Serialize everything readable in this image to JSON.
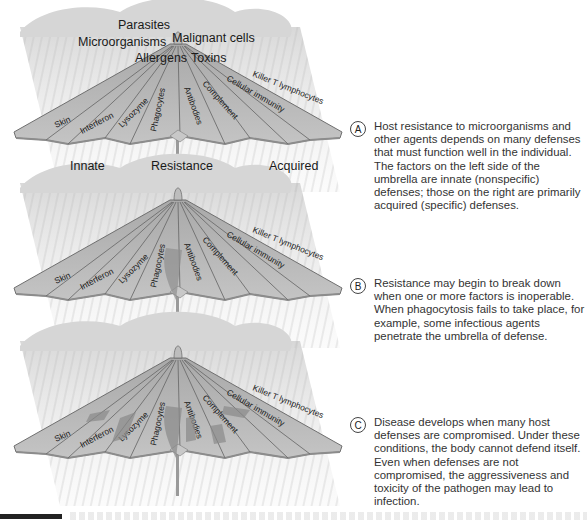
{
  "threats": {
    "parasites": "Parasites",
    "microorganisms": "Microorganisms",
    "malignant_cells": "Malignant cells",
    "allergens": "Allergens",
    "toxins": "Toxins"
  },
  "axis": {
    "innate": "Innate",
    "resistance": "Resistance",
    "acquired": "Acquired"
  },
  "umbrella_segments": [
    "Skin",
    "Interferon",
    "Lysozyme",
    "Phagocytes",
    "Antibodies",
    "Complement",
    "Cellular immunity",
    "Killer T lymphocytes"
  ],
  "panels": [
    {
      "letter": "A",
      "text": "Host resistance to microorganisms and other agents depends on many defenses that must function well in the individual. The factors on the left side of the umbrella are innate (nonspecific) defenses; those on the right are primarily acquired (specific) defenses."
    },
    {
      "letter": "B",
      "text": "Resistance may begin to break down when one or more factors is inoperable. When phagocytosis fails to take place, for example, some infectious agents penetrate the umbrella of defense."
    },
    {
      "letter": "C",
      "text": "Disease develops when many host defenses are compromised. Under these conditions, the body cannot defend itself. Even when defenses are not compromised, the aggressiveness and toxicity of the pathogen may lead to  infection."
    }
  ],
  "colors": {
    "umbrella_fill": "#b9b9b9",
    "umbrella_edge": "#7a7a7a",
    "cloud": "#d9d9d9",
    "rain": "#cfcfcf"
  }
}
